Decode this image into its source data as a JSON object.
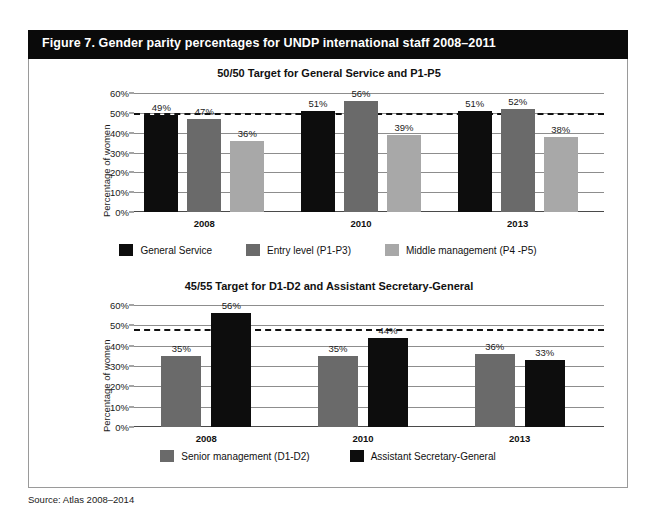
{
  "figure": {
    "title": "Figure 7. Gender parity percentages for UNDP international staff 2008–2011",
    "source": "Source: Atlas 2008–2014",
    "header_color": "#0a0a0a",
    "border_color": "#9a9a9a"
  },
  "colors": {
    "series_black": "#0d0d0d",
    "series_dark_gray": "#6a6a6a",
    "series_light_gray": "#a8a8a8",
    "gridline": "#8d8d8d",
    "target_line": "#111111"
  },
  "chart_data": [
    {
      "type": "bar",
      "title": "50/50 Target for General Service and P1-P5",
      "xlabel": "",
      "ylabel": "Percentage of women",
      "categories": [
        "2008",
        "2010",
        "2013"
      ],
      "ylim": [
        0,
        60
      ],
      "ytick_labels": [
        "0%",
        "10%",
        "20%",
        "30%",
        "40%",
        "50%",
        "60%"
      ],
      "ytick_values": [
        0,
        10,
        20,
        30,
        40,
        50,
        60
      ],
      "grid": true,
      "legend_position": "bottom",
      "target_line": {
        "value": 50,
        "label": "50/50 target",
        "style": "dashed"
      },
      "series": [
        {
          "name": "General Service",
          "color": "#0d0d0d",
          "values": [
            49,
            51,
            51
          ],
          "labels": [
            "49%",
            "51%",
            "51%"
          ]
        },
        {
          "name": "Entry level (P1-P3)",
          "color": "#6a6a6a",
          "values": [
            47,
            56,
            52
          ],
          "labels": [
            "47%",
            "56%",
            "52%"
          ]
        },
        {
          "name": "Middle management (P4 -P5)",
          "color": "#a8a8a8",
          "values": [
            36,
            39,
            38
          ],
          "labels": [
            "36%",
            "39%",
            "38%"
          ]
        }
      ]
    },
    {
      "type": "bar",
      "title": "45/55 Target for D1-D2 and Assistant Secretary-General",
      "xlabel": "",
      "ylabel": "Percentage of women",
      "categories": [
        "2008",
        "2010",
        "2013"
      ],
      "ylim": [
        0,
        60
      ],
      "ytick_labels": [
        "0%",
        "10%",
        "20%",
        "30%",
        "40%",
        "50%",
        "60%"
      ],
      "ytick_values": [
        0,
        10,
        20,
        30,
        40,
        50,
        60
      ],
      "grid": true,
      "legend_position": "bottom",
      "target_line": {
        "value": 48,
        "label": "45/55 target",
        "style": "dashed"
      },
      "series": [
        {
          "name": "Senior management (D1-D2)",
          "color": "#6a6a6a",
          "values": [
            35,
            35,
            36
          ],
          "labels": [
            "35%",
            "35%",
            "36%"
          ]
        },
        {
          "name": "Assistant Secretary-General",
          "color": "#0d0d0d",
          "values": [
            56,
            44,
            33
          ],
          "labels": [
            "56%",
            "44%",
            "33%"
          ]
        }
      ]
    }
  ]
}
